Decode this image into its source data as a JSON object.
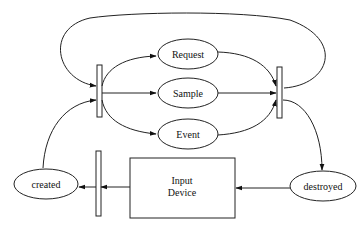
{
  "diagram": {
    "type": "state-transition",
    "nodes": {
      "request": {
        "label": "Request",
        "shape": "ellipse"
      },
      "sample": {
        "label": "Sample",
        "shape": "ellipse"
      },
      "event": {
        "label": "Event",
        "shape": "ellipse"
      },
      "created": {
        "label": "created",
        "shape": "ellipse"
      },
      "destroyed": {
        "label": "destroyed",
        "shape": "ellipse"
      },
      "input_device": {
        "label_line1": "Input",
        "label_line2": "Device",
        "shape": "rectangle"
      }
    },
    "bars": [
      "fork-bar",
      "join-bar",
      "init-bar"
    ],
    "edges": [
      {
        "from": "fork-bar",
        "to": "request"
      },
      {
        "from": "fork-bar",
        "to": "sample"
      },
      {
        "from": "fork-bar",
        "to": "event"
      },
      {
        "from": "request",
        "to": "join-bar"
      },
      {
        "from": "sample",
        "to": "join-bar"
      },
      {
        "from": "event",
        "to": "join-bar"
      },
      {
        "from": "join-bar",
        "to": "fork-bar",
        "note": "top loop"
      },
      {
        "from": "join-bar",
        "to": "destroyed"
      },
      {
        "from": "destroyed",
        "to": "input_device"
      },
      {
        "from": "input_device",
        "to": "init-bar"
      },
      {
        "from": "init-bar",
        "to": "created"
      },
      {
        "from": "created",
        "to": "fork-bar"
      }
    ],
    "colors": {
      "stroke": "#222222",
      "background": "#ffffff"
    }
  }
}
